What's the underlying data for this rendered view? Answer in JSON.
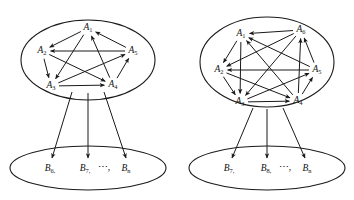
{
  "figure": {
    "background_color": "#ffffff",
    "stroke_color": "#1a1a1a"
  },
  "panels": [
    {
      "id": "left-panel",
      "name": "left-diagram",
      "upper_set": {
        "name": "upper-ellipse-left",
        "cx": 88,
        "cy": 60,
        "rx": 67,
        "ry": 40,
        "nodes": [
          {
            "id": "A1",
            "base": "A",
            "sub": "1",
            "x": 88,
            "y": 28
          },
          {
            "id": "A2",
            "base": "A",
            "sub": "2",
            "x": 42,
            "y": 51
          },
          {
            "id": "A3",
            "base": "A",
            "sub": "3",
            "x": 51,
            "y": 86
          },
          {
            "id": "A4",
            "base": "A",
            "sub": "4",
            "x": 113,
            "y": 85
          },
          {
            "id": "A5",
            "base": "A",
            "sub": "5",
            "x": 133,
            "y": 51
          }
        ],
        "arcs": [
          {
            "from": "A1",
            "to": "A2"
          },
          {
            "from": "A1",
            "to": "A3"
          },
          {
            "from": "A5",
            "to": "A2"
          },
          {
            "from": "A2",
            "to": "A3"
          },
          {
            "from": "A3",
            "to": "A4"
          },
          {
            "from": "A4",
            "to": "A1"
          },
          {
            "from": "A5",
            "to": "A1"
          },
          {
            "from": "A3",
            "to": "A5"
          },
          {
            "from": "A2",
            "to": "A4"
          },
          {
            "from": "A4",
            "to": "A5"
          }
        ]
      },
      "lower_set": {
        "name": "lower-ellipse-left",
        "cx": 88,
        "cy": 168,
        "rx": 78,
        "ry": 22,
        "labels": [
          {
            "kind": "node",
            "base": "B",
            "sub": "6,",
            "x": 50,
            "y": 169
          },
          {
            "kind": "node",
            "base": "B",
            "sub": "7,",
            "x": 85,
            "y": 169
          },
          {
            "kind": "dots",
            "text": "⋯,",
            "x": 104,
            "y": 168
          },
          {
            "kind": "node",
            "base": "B",
            "sub": "n",
            "x": 126,
            "y": 169
          }
        ]
      },
      "descending_arcs": [
        {
          "x1": 72,
          "y1": 92,
          "x2": 52,
          "y2": 158
        },
        {
          "x1": 88,
          "y1": 93,
          "x2": 88,
          "y2": 158
        },
        {
          "x1": 104,
          "y1": 92,
          "x2": 126,
          "y2": 158
        }
      ]
    },
    {
      "id": "right-panel",
      "name": "right-diagram",
      "upper_set": {
        "name": "upper-ellipse-right",
        "cx": 267,
        "cy": 62,
        "rx": 67,
        "ry": 45,
        "nodes": [
          {
            "id": "A1",
            "base": "A",
            "sub": "1",
            "x": 241,
            "y": 34
          },
          {
            "id": "A6",
            "base": "A",
            "sub": "6",
            "x": 301,
            "y": 30
          },
          {
            "id": "A2",
            "base": "A",
            "sub": "2",
            "x": 219,
            "y": 70
          },
          {
            "id": "A5",
            "base": "A",
            "sub": "5",
            "x": 317,
            "y": 70
          },
          {
            "id": "A3",
            "base": "A",
            "sub": "3",
            "x": 240,
            "y": 102
          },
          {
            "id": "A4",
            "base": "A",
            "sub": "4",
            "x": 298,
            "y": 101
          }
        ],
        "arcs": [
          {
            "from": "A6",
            "to": "A1"
          },
          {
            "from": "A1",
            "to": "A2"
          },
          {
            "from": "A1",
            "to": "A3"
          },
          {
            "from": "A2",
            "to": "A3"
          },
          {
            "from": "A3",
            "to": "A4"
          },
          {
            "from": "A5",
            "to": "A2"
          },
          {
            "from": "A4",
            "to": "A5"
          },
          {
            "from": "A4",
            "to": "A6"
          },
          {
            "from": "A5",
            "to": "A6"
          },
          {
            "from": "A2",
            "to": "A4"
          },
          {
            "from": "A3",
            "to": "A5"
          },
          {
            "from": "A4",
            "to": "A1"
          },
          {
            "from": "A6",
            "to": "A3"
          },
          {
            "from": "A6",
            "to": "A2"
          },
          {
            "from": "A5",
            "to": "A1"
          }
        ]
      },
      "lower_set": {
        "name": "lower-ellipse-right",
        "cx": 267,
        "cy": 168,
        "rx": 78,
        "ry": 22,
        "labels": [
          {
            "kind": "node",
            "base": "B",
            "sub": "7,",
            "x": 229,
            "y": 169
          },
          {
            "kind": "node",
            "base": "B",
            "sub": "8,",
            "x": 266,
            "y": 169
          },
          {
            "kind": "dots",
            "text": "⋯,",
            "x": 285,
            "y": 168
          },
          {
            "kind": "node",
            "base": "B",
            "sub": "n",
            "x": 307,
            "y": 169
          }
        ]
      },
      "descending_arcs": [
        {
          "x1": 253,
          "y1": 108,
          "x2": 232,
          "y2": 158
        },
        {
          "x1": 267,
          "y1": 109,
          "x2": 267,
          "y2": 158
        },
        {
          "x1": 283,
          "y1": 108,
          "x2": 305,
          "y2": 158
        }
      ]
    }
  ]
}
